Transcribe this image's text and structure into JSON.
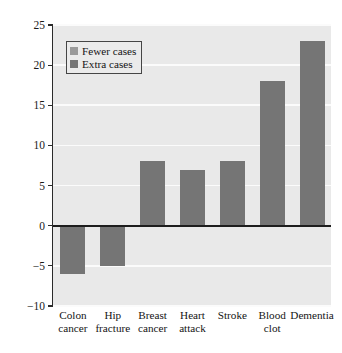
{
  "chart_data": {
    "type": "bar",
    "title": "",
    "xlabel": "",
    "ylabel": "Predicted number of cases",
    "categories": [
      "Colon\ncancer",
      "Hip\nfracture",
      "Breast\ncancer",
      "Heart\nattack",
      "Stroke",
      "Blood\nclot",
      "Dementia"
    ],
    "category_lines": [
      [
        "Colon",
        "cancer"
      ],
      [
        "Hip",
        "fracture"
      ],
      [
        "Breast",
        "cancer"
      ],
      [
        "Heart",
        "attack"
      ],
      [
        "Stroke",
        ""
      ],
      [
        "Blood",
        "clot"
      ],
      [
        "Dementia",
        ""
      ]
    ],
    "values": [
      -6,
      -5,
      8,
      7,
      8,
      18,
      23
    ],
    "ylim": [
      -10,
      25
    ],
    "yticks": [
      -10,
      -5,
      0,
      5,
      10,
      15,
      20,
      25
    ],
    "ytick_labels": [
      "−10",
      "−5",
      "0",
      "5",
      "10",
      "15",
      "20",
      "25"
    ],
    "grid": "horizontal",
    "legend_position": "upper-left",
    "legend": [
      {
        "label": "Fewer cases",
        "color": "#9a9a9a"
      },
      {
        "label": "Extra cases",
        "color": "#757575"
      }
    ],
    "colors": {
      "bar": "#757575",
      "fewer_cases": "#9a9a9a",
      "extra_cases": "#757575",
      "plot_background": "#e9e9e9",
      "gridline": "#fbfbfb",
      "axis": "#2b2b2b",
      "zero_line": "#1d1d1d",
      "text": "#141414"
    }
  }
}
